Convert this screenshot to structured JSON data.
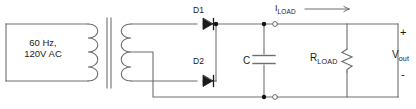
{
  "diagram": {
    "type": "circuit-schematic",
    "colors": {
      "wire": "#6e6e6e",
      "symbol": "#6e6e6e",
      "text": "#1a1a1a",
      "background": "#ffffff",
      "node_fill": "#111111"
    }
  },
  "labels": {
    "source_line1": "60 Hz,",
    "source_line2": "120V AC",
    "diode1": "D1",
    "diode2": "D2",
    "capacitor": "C",
    "load_current_symbol": "I",
    "load_current_subscript": "LOAD",
    "load_resistor_symbol": "R",
    "load_resistor_subscript": "LOAD",
    "output_symbol": "V",
    "output_subscript": "out",
    "polarity_positive": "+",
    "polarity_negative": "-"
  },
  "components": [
    {
      "name": "ac-source",
      "label": "60 Hz, 120V AC",
      "kind": "ac-voltage-source"
    },
    {
      "name": "transformer",
      "label": "",
      "kind": "center-tapped-transformer",
      "primary_turns": 4,
      "secondary_turns": 4
    },
    {
      "name": "diode-d1",
      "label": "D1",
      "kind": "diode"
    },
    {
      "name": "diode-d2",
      "label": "D2",
      "kind": "diode"
    },
    {
      "name": "capacitor-c",
      "label": "C",
      "kind": "capacitor"
    },
    {
      "name": "resistor-rload",
      "label": "RLOAD",
      "kind": "resistor"
    },
    {
      "name": "current-iload",
      "label": "ILOAD",
      "kind": "current-arrow"
    },
    {
      "name": "output-terminals",
      "label": "Vout",
      "kind": "terminal-pair"
    }
  ],
  "icons": {
    "diode": "diode-icon",
    "capacitor": "capacitor-icon",
    "resistor": "resistor-zigzag-icon",
    "transformer": "transformer-icon",
    "current_arrow": "arrow-right-icon",
    "node": "junction-dot-icon",
    "terminal": "open-terminal-icon"
  }
}
